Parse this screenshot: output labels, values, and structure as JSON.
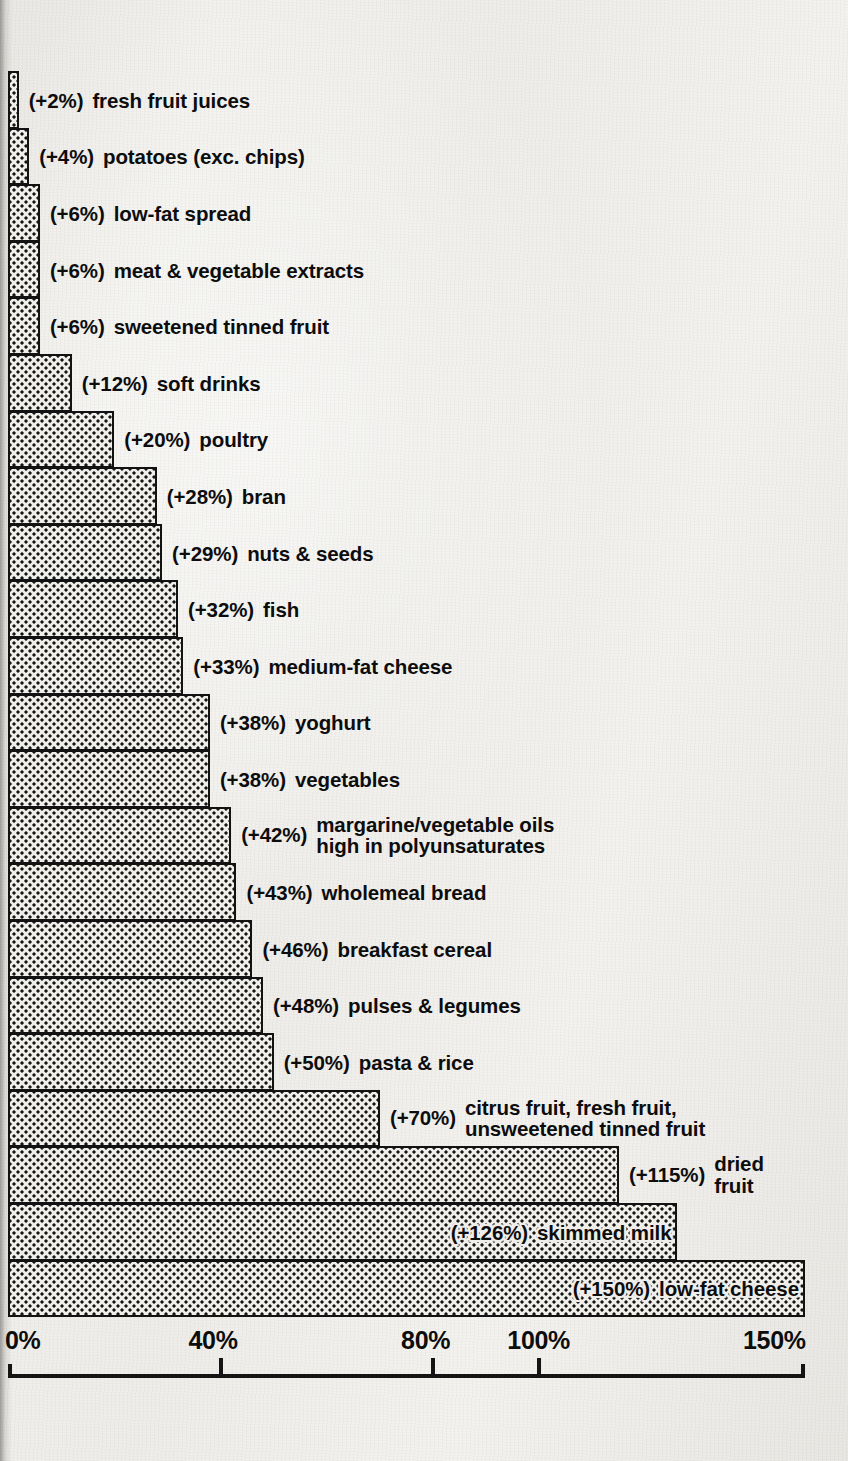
{
  "chart_data": {
    "type": "bar",
    "orientation": "horizontal",
    "title": "",
    "xlabel": "",
    "ylabel": "",
    "xlim": [
      0,
      150
    ],
    "grid": false,
    "legend": false,
    "tick_labels": [
      "0%",
      "40%",
      "80%",
      "100%",
      "150%"
    ],
    "ticks": [
      0,
      40,
      80,
      100,
      150
    ],
    "value_prefix": "(+",
    "value_suffix": "%)",
    "categories": [
      "fresh fruit juices",
      "potatoes (exc. chips)",
      "low-fat spread",
      "meat & vegetable extracts",
      "sweetened tinned fruit",
      "soft drinks",
      "poultry",
      "bran",
      "nuts & seeds",
      "fish",
      "medium-fat cheese",
      "yoghurt",
      "vegetables",
      "margarine/vegetable oils\nhigh in polyunsaturates",
      "wholemeal bread",
      "breakfast cereal",
      "pulses & legumes",
      "pasta & rice",
      "citrus fruit, fresh fruit,\nunsweetened tinned fruit",
      "dried\nfruit",
      "skimmed milk",
      "low-fat cheese"
    ],
    "values": [
      2,
      4,
      6,
      6,
      6,
      12,
      20,
      28,
      29,
      32,
      33,
      38,
      38,
      42,
      43,
      46,
      48,
      50,
      70,
      115,
      126,
      150
    ],
    "value_labels": [
      "(+2%)",
      "(+4%)",
      "(+6%)",
      "(+6%)",
      "(+6%)",
      "(+12%)",
      "(+20%)",
      "(+28%)",
      "(+29%)",
      "(+32%)",
      "(+33%)",
      "(+38%)",
      "(+38%)",
      "(+42%)",
      "(+43%)",
      "(+46%)",
      "(+48%)",
      "(+50%)",
      "(+70%)",
      "(+115%)",
      "(+126%)",
      "(+150%)"
    ],
    "bars": [
      {
        "label": "(+2%)",
        "name": "fresh fruit juices",
        "value": 2,
        "label_inside": false,
        "two_line": false
      },
      {
        "label": "(+4%)",
        "name": "potatoes (exc. chips)",
        "value": 4,
        "label_inside": false,
        "two_line": false
      },
      {
        "label": "(+6%)",
        "name": "low-fat spread",
        "value": 6,
        "label_inside": false,
        "two_line": false
      },
      {
        "label": "(+6%)",
        "name": "meat & vegetable extracts",
        "value": 6,
        "label_inside": false,
        "two_line": false
      },
      {
        "label": "(+6%)",
        "name": "sweetened tinned fruit",
        "value": 6,
        "label_inside": false,
        "two_line": false
      },
      {
        "label": "(+12%)",
        "name": "soft drinks",
        "value": 12,
        "label_inside": false,
        "two_line": false
      },
      {
        "label": "(+20%)",
        "name": "poultry",
        "value": 20,
        "label_inside": false,
        "two_line": false
      },
      {
        "label": "(+28%)",
        "name": "bran",
        "value": 28,
        "label_inside": false,
        "two_line": false
      },
      {
        "label": "(+29%)",
        "name": "nuts & seeds",
        "value": 29,
        "label_inside": false,
        "two_line": false
      },
      {
        "label": "(+32%)",
        "name": "fish",
        "value": 32,
        "label_inside": false,
        "two_line": false
      },
      {
        "label": "(+33%)",
        "name": "medium-fat cheese",
        "value": 33,
        "label_inside": false,
        "two_line": false
      },
      {
        "label": "(+38%)",
        "name": "yoghurt",
        "value": 38,
        "label_inside": false,
        "two_line": false
      },
      {
        "label": "(+38%)",
        "name": "vegetables",
        "value": 38,
        "label_inside": false,
        "two_line": false
      },
      {
        "label": "(+42%)",
        "name": "margarine/vegetable oils\nhigh in polyunsaturates",
        "value": 42,
        "label_inside": false,
        "two_line": true
      },
      {
        "label": "(+43%)",
        "name": "wholemeal bread",
        "value": 43,
        "label_inside": false,
        "two_line": false
      },
      {
        "label": "(+46%)",
        "name": "breakfast cereal",
        "value": 46,
        "label_inside": false,
        "two_line": false
      },
      {
        "label": "(+48%)",
        "name": "pulses & legumes",
        "value": 48,
        "label_inside": false,
        "two_line": false
      },
      {
        "label": "(+50%)",
        "name": "pasta & rice",
        "value": 50,
        "label_inside": false,
        "two_line": false
      },
      {
        "label": "(+70%)",
        "name": "citrus fruit, fresh fruit,\nunsweetened tinned fruit",
        "value": 70,
        "label_inside": false,
        "two_line": true
      },
      {
        "label": "(+115%)",
        "name": "dried\nfruit",
        "value": 115,
        "label_inside": false,
        "two_line": true
      },
      {
        "label": "(+126%)",
        "name": "skimmed milk",
        "value": 126,
        "label_inside": true,
        "two_line": false
      },
      {
        "label": "(+150%)",
        "name": "low-fat cheese",
        "value": 150,
        "label_inside": true,
        "two_line": false
      }
    ],
    "colors": {
      "paper": "#eeede9",
      "bar_fill": "#efeeea",
      "bar_dot": "#151515",
      "bar_outline": "#121212",
      "text": "#0d0d0d",
      "axis": "#141414"
    }
  }
}
